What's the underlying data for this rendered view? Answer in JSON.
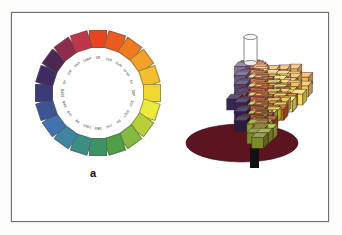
{
  "figure": {
    "panels": [
      {
        "id": "a",
        "caption": "a",
        "title": "Munsell hue circle"
      },
      {
        "id": "b",
        "caption": "b",
        "title": "Munsell colour solid"
      }
    ],
    "background_color": "#ffffff",
    "border_color": "#6f7275"
  },
  "chart_data": {
    "type": "pie",
    "xlabel": "",
    "ylabel": "",
    "legend_position": "none",
    "grid": false,
    "categories": [
      "5R",
      "10R",
      "5YR",
      "10YR",
      "5Y",
      "10Y",
      "5GY",
      "10GY",
      "5G",
      "10G",
      "5BG",
      "10BG",
      "5B",
      "10B",
      "5PB",
      "10PB",
      "5P",
      "10P",
      "5RP",
      "10RP"
    ],
    "values": [
      18,
      18,
      18,
      18,
      18,
      18,
      18,
      18,
      18,
      18,
      18,
      18,
      18,
      18,
      18,
      18,
      18,
      18,
      18,
      18
    ],
    "colors": [
      "#e8441f",
      "#ec5a1e",
      "#ef7a20",
      "#f3a127",
      "#f2c02c",
      "#f0d831",
      "#ecea3c",
      "#b9cf3a",
      "#86b93f",
      "#4e9f45",
      "#3c9464",
      "#3b8f82",
      "#3f85a2",
      "#4273b0",
      "#3d5494",
      "#3a3b78",
      "#3d2b62",
      "#4c2752",
      "#8e2c4c",
      "#c03549"
    ],
    "angles_deg": [
      0,
      18,
      36,
      54,
      72,
      90,
      108,
      126,
      144,
      162,
      180,
      198,
      216,
      234,
      252,
      270,
      288,
      306,
      324,
      342
    ]
  },
  "panel_a": {
    "caption": "a",
    "swatch_count": 20,
    "hues": [
      {
        "label": "5R",
        "color": "#e8441f",
        "angle": 0
      },
      {
        "label": "10R",
        "color": "#ec5a1e",
        "angle": 18
      },
      {
        "label": "5YR",
        "color": "#ef7a20",
        "angle": 36
      },
      {
        "label": "10YR",
        "color": "#f3a127",
        "angle": 54
      },
      {
        "label": "5Y",
        "color": "#f2c02c",
        "angle": 72
      },
      {
        "label": "10Y",
        "color": "#f0d831",
        "angle": 90
      },
      {
        "label": "5GY",
        "color": "#ecea3c",
        "angle": 108
      },
      {
        "label": "10GY",
        "color": "#b9cf3a",
        "angle": 126
      },
      {
        "label": "5G",
        "color": "#86b93f",
        "angle": 144
      },
      {
        "label": "10G",
        "color": "#4e9f45",
        "angle": 162
      },
      {
        "label": "5BG",
        "color": "#3c9464",
        "angle": 180
      },
      {
        "label": "10BG",
        "color": "#3b8f82",
        "angle": 198
      },
      {
        "label": "5B",
        "color": "#3f85a2",
        "angle": 216
      },
      {
        "label": "10B",
        "color": "#4273b0",
        "angle": 234
      },
      {
        "label": "5PB",
        "color": "#3d5494",
        "angle": 252
      },
      {
        "label": "10PB",
        "color": "#3a3b78",
        "angle": 270
      },
      {
        "label": "5P",
        "color": "#3d2b62",
        "angle": 288
      },
      {
        "label": "10P",
        "color": "#4c2752",
        "angle": 306
      },
      {
        "label": "5RP",
        "color": "#8e2c4c",
        "angle": 324
      },
      {
        "label": "10RP",
        "color": "#c03549",
        "angle": 342
      }
    ]
  },
  "panel_b": {
    "caption": "b",
    "axis_top_color": "#ffffff",
    "axis_bottom_color": "#111111",
    "base_color": "#5d1421",
    "description": "Three dimensional Munsell colour solid built from stacked chroma blocks around a neutral value axis"
  }
}
